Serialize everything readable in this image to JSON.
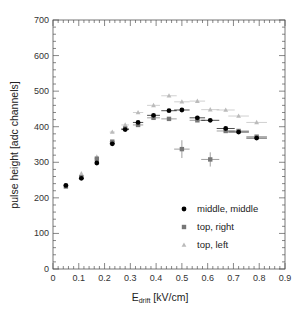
{
  "chart_data": {
    "type": "scatter",
    "title": "",
    "xlabel": "E_drift [kV/cm]",
    "xlabel_main": "E",
    "xlabel_sub": "drift",
    "xlabel_unit": " [kV/cm]",
    "ylabel": "pulse height [adc channels]",
    "xlim": [
      0,
      0.9
    ],
    "ylim": [
      0,
      700
    ],
    "x_ticks": [
      "0",
      "0.1",
      "0.2",
      "0.3",
      "0.4",
      "0.5",
      "0.6",
      "0.7",
      "0.8",
      "0.9"
    ],
    "y_ticks": [
      "0",
      "100",
      "200",
      "300",
      "400",
      "500",
      "600",
      "700"
    ],
    "grid": false,
    "legend_position": "lower right inside",
    "series": [
      {
        "name": "middle, middle",
        "marker": "circle",
        "color": "#000000",
        "x": [
          0.05,
          0.11,
          0.17,
          0.23,
          0.28,
          0.33,
          0.39,
          0.45,
          0.5,
          0.56,
          0.61,
          0.67,
          0.72,
          0.79
        ],
        "values": [
          235,
          255,
          298,
          352,
          392,
          412,
          432,
          445,
          447,
          425,
          418,
          395,
          385,
          368
        ],
        "xerr": [
          0,
          0,
          0,
          0.01,
          0.015,
          0.02,
          0.025,
          0.03,
          0.03,
          0.03,
          0.035,
          0.035,
          0.04,
          0.04
        ]
      },
      {
        "name": "top, right",
        "marker": "square",
        "color": "#777777",
        "x": [
          0.05,
          0.11,
          0.17,
          0.23,
          0.28,
          0.33,
          0.39,
          0.45,
          0.5,
          0.56,
          0.61,
          0.67,
          0.72,
          0.79
        ],
        "values": [
          232,
          258,
          310,
          358,
          395,
          405,
          425,
          422,
          337,
          418,
          308,
          388,
          388,
          372
        ],
        "xerr": [
          0,
          0,
          0,
          0.01,
          0.015,
          0.02,
          0.025,
          0.03,
          0.03,
          0.03,
          0.035,
          0.035,
          0.04,
          0.04
        ],
        "yerr": [
          0,
          0,
          0,
          0,
          0,
          0,
          0,
          0,
          25,
          0,
          20,
          0,
          0,
          0
        ]
      },
      {
        "name": "top, left",
        "marker": "triangle",
        "color": "#bbbbbb",
        "x": [
          0.11,
          0.17,
          0.23,
          0.28,
          0.33,
          0.39,
          0.45,
          0.5,
          0.56,
          0.61,
          0.67,
          0.72,
          0.79
        ],
        "values": [
          268,
          315,
          385,
          405,
          440,
          460,
          487,
          470,
          472,
          448,
          447,
          430,
          412
        ],
        "xerr": [
          0,
          0,
          0.01,
          0.015,
          0.02,
          0.025,
          0.03,
          0.03,
          0.03,
          0.035,
          0.035,
          0.04,
          0.04
        ]
      }
    ]
  },
  "plot": {
    "left": 53,
    "top": 20,
    "right": 285,
    "bottom": 269
  }
}
